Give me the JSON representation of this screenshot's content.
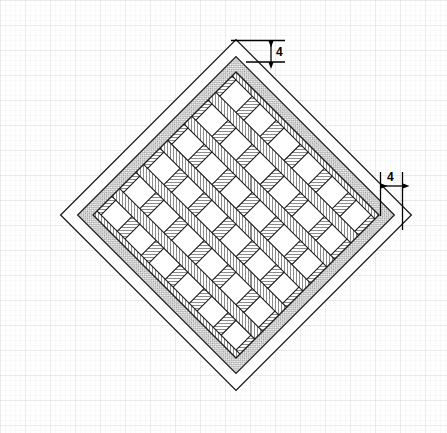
{
  "drawing": {
    "title": "Lattice grille plan view",
    "description": "Square panel rotated 45 degrees containing an outer border, an inner stippled frame band and a 6 by 6 diagonal lattice of crossing hatched strips",
    "canvas": {
      "width": 447,
      "height": 433
    },
    "background": {
      "name": "graph-paper",
      "minor_grid_px": 5,
      "major_grid_px": 25,
      "minor_color": "#e8e8e8",
      "major_color": "#d0d0d0",
      "paper_color": "#ffffff"
    },
    "colors": {
      "outline": "#1a1a1a",
      "frame_band_fill": "#c9c9c9",
      "strip_fill": "#ffffff",
      "hatch_line": "#333333",
      "cell_fill": "#ffffff",
      "dimension_line": "#000000"
    },
    "geometry": {
      "rotation_deg": 45,
      "outer_diamond": {
        "top": {
          "x": 239,
          "y": 36
        },
        "right": {
          "x": 408,
          "y": 222
        },
        "bottom": {
          "x": 232,
          "y": 395
        },
        "left": {
          "x": 64,
          "y": 215
        }
      },
      "center": {
        "x": 236,
        "y": 215
      },
      "outer_half_diagonal": 176,
      "frame_gap": 12,
      "frame_band_width": 11,
      "lattice": {
        "rows": 6,
        "columns": 6,
        "strip_width": 11,
        "cell_pitch": 41
      }
    },
    "dimensions": [
      {
        "id": "top-offset",
        "label": "4",
        "value": 4,
        "orientation": "vertical",
        "note": "border offset at top vertex",
        "line_x": 271,
        "y_start": 40,
        "y_end": 62,
        "ext_left_x": 231,
        "text_x": 277,
        "text_y": 55
      },
      {
        "id": "right-offset",
        "label": "4",
        "value": 4,
        "orientation": "horizontal",
        "note": "border offset at right vertex",
        "line_y": 186,
        "x_start": 380,
        "x_end": 402,
        "ext_top_y": 222,
        "text_x": 391,
        "text_y": 180
      }
    ]
  }
}
